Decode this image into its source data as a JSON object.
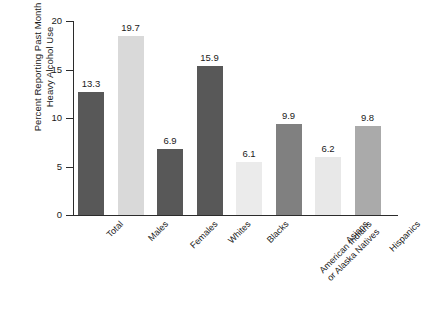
{
  "chart_data": {
    "type": "bar",
    "title": "",
    "xlabel": "",
    "ylabel_line1": "Percent Reporting Past Month",
    "ylabel_line2": "Heavy Alcohol Use",
    "ylim": [
      0,
      20
    ],
    "yticks": [
      0,
      5,
      10,
      15,
      20
    ],
    "ytick_labels": [
      "0",
      "5",
      "10",
      "15",
      "20"
    ],
    "grid": false,
    "legend": "none",
    "categories": [
      "Total",
      "Males",
      "Females",
      "Whites",
      "Blacks",
      "American Indians or Alaska Natives",
      "Asians",
      "Hispanics"
    ],
    "category_label_lines": [
      [
        "Total"
      ],
      [
        "Males"
      ],
      [
        "Females"
      ],
      [
        "Whites"
      ],
      [
        "Blacks"
      ],
      [
        "American Indians",
        "or Alaska Natives"
      ],
      [
        "Asians"
      ],
      [
        "Hispanics"
      ]
    ],
    "values": [
      13.3,
      19.7,
      6.9,
      15.9,
      6.1,
      9.9,
      6.2,
      9.8
    ],
    "value_labels": [
      "13.3",
      "19.7",
      "6.9",
      "15.9",
      "6.1",
      "9.9",
      "6.2",
      "9.8"
    ],
    "plotted_heights": [
      12.7,
      18.5,
      6.85,
      15.35,
      5.45,
      9.4,
      5.95,
      9.2
    ],
    "bar_colors": [
      "#585858",
      "#d9d9d9",
      "#585858",
      "#585858",
      "#ebebeb",
      "#808080",
      "#e8e8e8",
      "#aaaaaa"
    ]
  }
}
